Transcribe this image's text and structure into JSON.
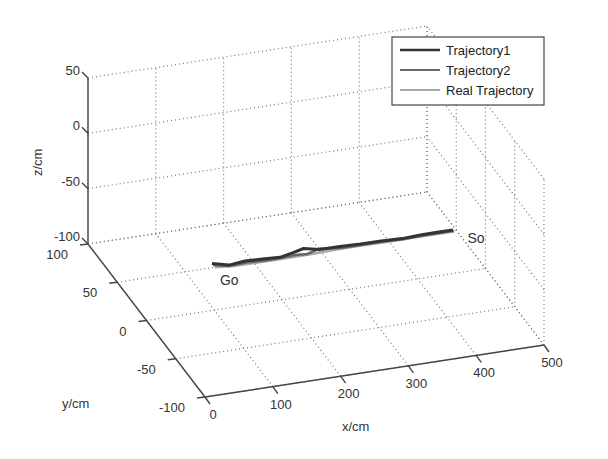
{
  "chart_data": {
    "type": "line",
    "projection": "3d",
    "title": "",
    "xlabel": "x/cm",
    "ylabel": "y/cm",
    "zlabel": "z/cm",
    "xlim": [
      0,
      500
    ],
    "ylim": [
      -100,
      100
    ],
    "zlim": [
      -100,
      50
    ],
    "xticks": [
      0,
      100,
      200,
      300,
      400,
      500
    ],
    "yticks": [
      -100,
      -50,
      0,
      50,
      100
    ],
    "zticks": [
      -100,
      -50,
      0,
      50
    ],
    "grid": true,
    "legend_position": "top-right",
    "series": [
      {
        "name": "Trajectory1",
        "color": "#333333",
        "x": [
          144,
          165,
          190,
          215,
          240,
          262,
          280,
          300,
          330,
          360,
          390,
          420,
          450,
          475,
          496
        ],
        "y": [
          55,
          50,
          52,
          51,
          50,
          53,
          56,
          52,
          52,
          51,
          51,
          50,
          51,
          51,
          51
        ],
        "z": [
          -100,
          -100,
          -100,
          -100,
          -100,
          -100,
          -100,
          -100,
          -100,
          -100,
          -100,
          -100,
          -100,
          -100,
          -100
        ]
      },
      {
        "name": "Trajectory2",
        "color": "#666666",
        "x": [
          144,
          165,
          190,
          215,
          240,
          262,
          280,
          300,
          330,
          360,
          390,
          420,
          450,
          475,
          496
        ],
        "y": [
          53,
          49,
          50,
          49,
          49,
          50,
          49,
          53,
          50,
          50,
          50,
          49,
          50,
          50,
          50
        ],
        "z": [
          -100,
          -100,
          -100,
          -100,
          -100,
          -100,
          -100,
          -100,
          -100,
          -100,
          -100,
          -100,
          -100,
          -100,
          -100
        ]
      },
      {
        "name": "Real Trajectory",
        "color": "#a8a8a8",
        "x": [
          144,
          170,
          200,
          230,
          260,
          290,
          320,
          350,
          380,
          410,
          440,
          470,
          496
        ],
        "y": [
          50,
          48,
          48,
          48,
          48,
          48,
          49,
          49,
          49,
          49,
          49,
          49,
          49
        ],
        "z": [
          -100,
          -100,
          -100,
          -100,
          -100,
          -100,
          -100,
          -100,
          -100,
          -100,
          -100,
          -100,
          -100
        ]
      }
    ],
    "annotations": [
      {
        "text": "Go",
        "x": 144,
        "y": 50,
        "z": -100
      },
      {
        "text": "So",
        "x": 496,
        "y": 50,
        "z": -100
      }
    ]
  }
}
